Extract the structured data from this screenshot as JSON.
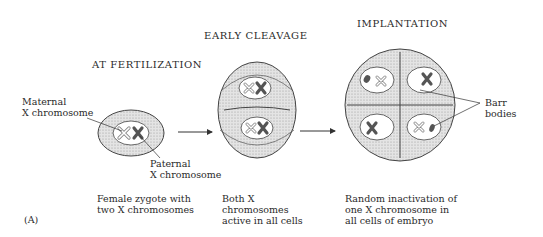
{
  "stages": [
    {
      "title": "AT FERTILIZATION",
      "caption": "Female zygote with\ntwo X chromosomes"
    },
    {
      "title": "EARLY CLEAVAGE",
      "caption": "Both X\nchromosomes\nactive in all cells"
    },
    {
      "title": "IMPLANTATION",
      "caption": "Random inactivation of\none X chromosome in\nall cells of embryo"
    }
  ],
  "labels": {
    "maternal": "Maternal\nX chromosome",
    "paternal": "Paternal\nX chromosome",
    "barr": "Barr\nbodies"
  },
  "panel_label": "(A)",
  "colors": {
    "stipple": "#d4d4d4",
    "outline": "#444444",
    "active_x": "#555555"
  }
}
